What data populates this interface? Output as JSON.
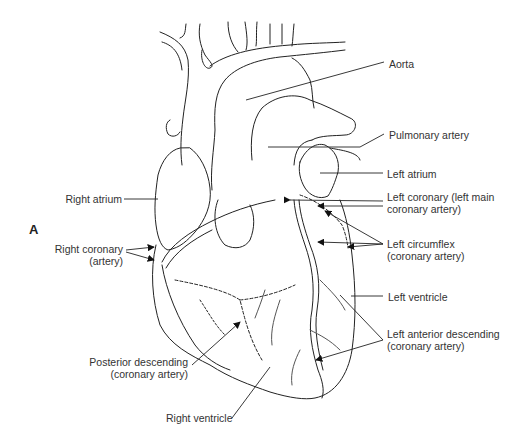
{
  "figure": {
    "panel_label": "A",
    "labels": {
      "aorta": "Aorta",
      "pulmonary_artery": "Pulmonary artery",
      "left_atrium": "Left atrium",
      "right_atrium": "Right atrium",
      "left_coronary_1": "Left coronary (left main",
      "left_coronary_2": "coronary artery)",
      "right_coronary_1": "Right coronary",
      "right_coronary_2": "(artery)",
      "left_circumflex_1": "Left circumflex",
      "left_circumflex_2": "(coronary artery)",
      "left_ventricle": "Left ventricle",
      "lad_1": "Left anterior descending",
      "lad_2": "(coronary artery)",
      "posterior_descending_1": "Posterior descending",
      "posterior_descending_2": "(coronary artery)",
      "right_ventricle": "Right ventricle"
    }
  }
}
